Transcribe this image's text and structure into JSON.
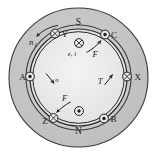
{
  "colors": {
    "background": "#ffffff",
    "stator_fill": "#c6c6c6",
    "rotor_fill": "#dedede",
    "core_fill": "#ededed",
    "outline": "#2b2b2b",
    "label": "#1a1a1a"
  },
  "poles": [
    {
      "id": "pole-s",
      "label": "S",
      "position": "top"
    },
    {
      "id": "pole-n",
      "label": "N",
      "position": "bottom"
    }
  ],
  "conductors": [
    {
      "id": "conductor-y",
      "label": "Y",
      "symbol": "cross-circle",
      "symbol_meaning": "current-into-page",
      "position": "upper-left"
    },
    {
      "id": "conductor-c",
      "label": "C",
      "symbol": "dot-circle",
      "symbol_meaning": "current-out-of-page",
      "position": "upper-right"
    },
    {
      "id": "conductor-a",
      "label": "A",
      "symbol": "dot-circle",
      "symbol_meaning": "current-out-of-page",
      "position": "left"
    },
    {
      "id": "conductor-x",
      "label": "X",
      "symbol": "cross-circle",
      "symbol_meaning": "current-into-page",
      "position": "right"
    },
    {
      "id": "conductor-z",
      "label": "Z",
      "symbol": "cross-circle",
      "symbol_meaning": "current-into-page",
      "position": "lower-left"
    },
    {
      "id": "conductor-b",
      "label": "B",
      "symbol": "dot-circle",
      "symbol_meaning": "current-out-of-page",
      "position": "lower-right"
    }
  ],
  "rotor_conductors": [
    {
      "id": "rotor-conductor-top",
      "symbol": "cross-circle",
      "symbol_meaning": "current-into-page",
      "label": "",
      "position": "rotor-top"
    },
    {
      "id": "rotor-conductor-bottom",
      "symbol": "dot-circle",
      "symbol_meaning": "current-out-of-page",
      "label": "",
      "position": "rotor-bottom"
    }
  ],
  "vectors": [
    {
      "id": "speed-n1",
      "label": "n",
      "subscript": "1",
      "kind": "rotation-arrow",
      "position": "outer-upper-left"
    },
    {
      "id": "emf-ei",
      "label": "e, i",
      "subscript": "",
      "kind": "emf-current-label",
      "position": "rotor-top-center"
    },
    {
      "id": "force-f-upper",
      "label": "F",
      "subscript": "",
      "kind": "force-arrow",
      "position": "rotor-upper-right"
    },
    {
      "id": "force-f-lower",
      "label": "F",
      "subscript": "",
      "kind": "force-arrow",
      "position": "rotor-lower-left"
    },
    {
      "id": "speed-n",
      "label": "n",
      "subscript": "",
      "kind": "speed-arrow",
      "position": "rotor-left-center"
    },
    {
      "id": "torque-t",
      "label": "T",
      "subscript": "",
      "kind": "torque-arrow",
      "position": "rotor-right-center"
    }
  ]
}
